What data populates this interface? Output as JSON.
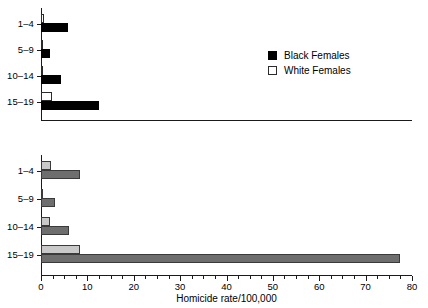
{
  "chart_data": [
    {
      "type": "bar",
      "orientation": "horizontal",
      "panel": "females",
      "title": "",
      "xlabel": "",
      "ylabel": "",
      "xlim": [
        0,
        80
      ],
      "grid": false,
      "legend_position": "right",
      "categories": [
        "1–4",
        "5–9",
        "10–14",
        "15–19"
      ],
      "series": [
        {
          "name": "Black Females",
          "color": "#000000",
          "values": [
            5.9,
            1.9,
            4.3,
            12.5
          ]
        },
        {
          "name": "White Females",
          "color": "#ffffff",
          "values": [
            0.6,
            0.4,
            0.5,
            2.4
          ]
        }
      ]
    },
    {
      "type": "bar",
      "orientation": "horizontal",
      "panel": "males",
      "title": "",
      "xlabel": "Homicide rate/100,000",
      "ylabel": "",
      "xlim": [
        0,
        80
      ],
      "xticks": [
        0,
        10,
        20,
        30,
        40,
        50,
        60,
        70,
        80
      ],
      "xticklabels": [
        "0",
        "10",
        "20",
        "30",
        "40",
        "50",
        "60",
        "70",
        "80"
      ],
      "minor_tick_interval": 2.5,
      "grid": false,
      "legend_position": "right",
      "categories": [
        "1–4",
        "5–9",
        "10–14",
        "15–19"
      ],
      "series": [
        {
          "name": "Black Males",
          "color": "#6e6e6e",
          "values": [
            8.4,
            3.1,
            6.1,
            77.5
          ]
        },
        {
          "name": "White Males",
          "color": "#c9c9c9",
          "values": [
            2.2,
            0.5,
            1.9,
            8.4
          ]
        }
      ]
    }
  ],
  "females": {
    "categories": [
      {
        "label": "1–4"
      },
      {
        "label": "5–9"
      },
      {
        "label": "10–14"
      },
      {
        "label": "15–19"
      }
    ],
    "legend": [
      {
        "label": "Black Females",
        "swatch": "black-filled-swatch"
      },
      {
        "label": "White Females",
        "swatch": "white-open-swatch"
      }
    ]
  },
  "males": {
    "categories": [
      {
        "label": "1–4"
      },
      {
        "label": "5–9"
      },
      {
        "label": "10–14"
      },
      {
        "label": "15–19"
      }
    ],
    "legend": [
      {
        "label": "Black Males",
        "swatch": "dark-gray-swatch"
      },
      {
        "label": "White Males",
        "swatch": "light-gray-swatch"
      }
    ],
    "xaxis": {
      "title": "Homicide rate/100,000",
      "ticklabels": [
        "0",
        "10",
        "20",
        "30",
        "40",
        "50",
        "60",
        "70",
        "80"
      ]
    }
  }
}
